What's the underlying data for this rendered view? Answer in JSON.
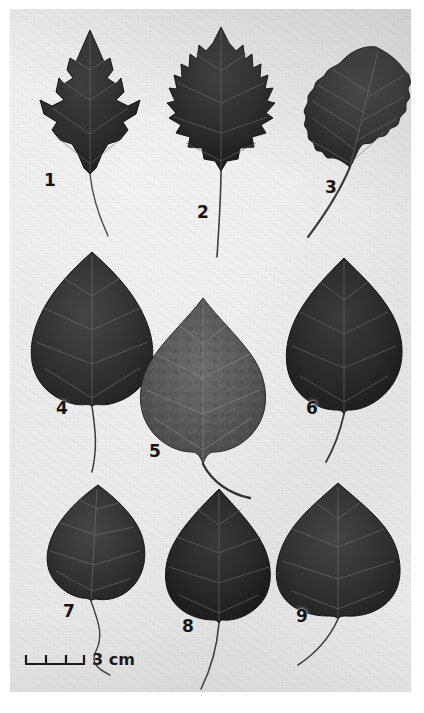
{
  "plate": {
    "title": "Plate of nine pressed leaf specimens",
    "caption_visible": false,
    "background_color": "#e8e8e8",
    "ink_color": "#2a2a2a",
    "rows": 3,
    "columns": 3
  },
  "scale": {
    "label": "3 cm",
    "value": 3,
    "unit": "cm",
    "tick_count": 4,
    "segments": 3,
    "bar_length_px": 60
  },
  "specimens": [
    {
      "number": "1",
      "label_x": 44,
      "label_y": 172,
      "shape": "deeply-lobed-maple-like",
      "tone": "very-dark",
      "petiole": "long-slender-curving-down-right",
      "row": 1,
      "column": 1
    },
    {
      "number": "2",
      "label_x": 197,
      "label_y": 204,
      "shape": "broad-coarsely-toothed-deltoid",
      "tone": "very-dark",
      "petiole": "long-straight-downward",
      "row": 1,
      "column": 2
    },
    {
      "number": "3",
      "label_x": 325,
      "label_y": 179,
      "shape": "ovate-crenate-margin",
      "tone": "dark",
      "petiole": "thick-curving-down-left",
      "row": 1,
      "column": 3
    },
    {
      "number": "4",
      "label_x": 55,
      "label_y": 400,
      "shape": "broad-deltoid-entire-margin",
      "tone": "dark",
      "petiole": "long-slender-curving-down-right",
      "row": 2,
      "column": 1
    },
    {
      "number": "5",
      "label_x": 148,
      "label_y": 443,
      "shape": "cordate-mottled",
      "tone": "medium-grey-mottled",
      "petiole": "thick-curving-down-right",
      "row": 2,
      "column": 2
    },
    {
      "number": "6",
      "label_x": 305,
      "label_y": 400,
      "shape": "ovate-cordate",
      "tone": "very-dark",
      "petiole": "short-curving-down-left",
      "row": 2,
      "column": 3
    },
    {
      "number": "7",
      "label_x": 62,
      "label_y": 603,
      "shape": "rhombic-deltoid",
      "tone": "dark",
      "petiole": "long-sinuous-down-right",
      "row": 3,
      "column": 1
    },
    {
      "number": "8",
      "label_x": 182,
      "label_y": 618,
      "shape": "ovate-deltoid-serrate",
      "tone": "very-dark",
      "petiole": "long-curving-down-left",
      "row": 3,
      "column": 2
    },
    {
      "number": "9",
      "label_x": 296,
      "label_y": 608,
      "shape": "broad-cordate",
      "tone": "dark",
      "petiole": "curving-down-left",
      "row": 3,
      "column": 3
    }
  ]
}
